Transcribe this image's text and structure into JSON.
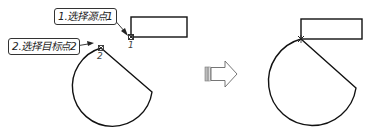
{
  "diagram": {
    "before": {
      "callout_source": "1.选择源点1",
      "callout_target": "2.选择目标点2",
      "point_source_label": "1",
      "point_target_label": "2"
    },
    "transition": {
      "icon": "right-arrow-icon"
    },
    "after": {
      "description": "Arc shape moved so target point 2 coincides with source point 1 at rectangle corner"
    }
  },
  "colors": {
    "stroke": "#111111",
    "callout_border": "#333333",
    "arrow_outline": "#666666"
  }
}
